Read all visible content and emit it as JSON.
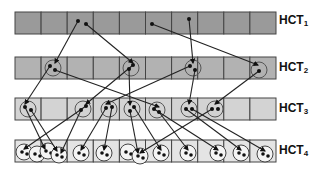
{
  "diagram": {
    "rows": [
      {
        "label": "HCT",
        "sub": "1",
        "y": 12,
        "fill": "#9a9a9a"
      },
      {
        "label": "HCT",
        "sub": "2",
        "y": 57,
        "fill": "#b2b2b2"
      },
      {
        "label": "HCT",
        "sub": "3",
        "y": 98,
        "fill": "#d3d3d3"
      },
      {
        "label": "HCT",
        "sub": "4",
        "y": 140,
        "fill": "#e4e4e4"
      }
    ],
    "grid": {
      "x0": 15,
      "cell_w": 26.1,
      "cell_h": 22,
      "cells": 10
    },
    "row1_dots": [
      [
        78,
        21
      ],
      [
        86,
        24
      ],
      [
        152,
        24
      ],
      [
        189,
        19
      ]
    ],
    "row2_circles": [
      {
        "cx": 53,
        "cy": 68,
        "dots": [
          [
            50,
            66
          ],
          [
            55,
            70
          ]
        ]
      },
      {
        "cx": 131,
        "cy": 68,
        "dots": [
          [
            133,
            65
          ],
          [
            129,
            69
          ]
        ]
      },
      {
        "cx": 193,
        "cy": 68,
        "dots": [
          [
            190,
            66
          ],
          [
            195,
            70
          ]
        ]
      },
      {
        "cx": 259,
        "cy": 70,
        "dots": [
          [
            259,
            71
          ]
        ]
      }
    ],
    "row3_circles": [
      {
        "cx": 28,
        "cy": 109,
        "dots": [
          [
            25,
            107
          ],
          [
            31,
            110
          ]
        ]
      },
      {
        "cx": 83,
        "cy": 109,
        "dots": [
          [
            81,
            110
          ],
          [
            86,
            106
          ]
        ]
      },
      {
        "cx": 109,
        "cy": 109,
        "dots": [
          [
            106,
            108
          ],
          [
            112,
            107
          ]
        ]
      },
      {
        "cx": 132,
        "cy": 109,
        "dots": [
          [
            130,
            111
          ],
          [
            134,
            107
          ]
        ]
      },
      {
        "cx": 157,
        "cy": 110,
        "dots": [
          [
            154,
            109
          ],
          [
            159,
            112
          ]
        ]
      },
      {
        "cx": 189,
        "cy": 109,
        "dots": [
          [
            186,
            109
          ],
          [
            192,
            109
          ]
        ]
      },
      {
        "cx": 215,
        "cy": 109,
        "dots": [
          [
            212,
            109
          ],
          [
            218,
            109
          ]
        ]
      }
    ],
    "row4_circles": [
      {
        "cx": 24,
        "cy": 152
      },
      {
        "cx": 37,
        "cy": 154
      },
      {
        "cx": 48,
        "cy": 151
      },
      {
        "cx": 59,
        "cy": 155
      },
      {
        "cx": 81,
        "cy": 153
      },
      {
        "cx": 104,
        "cy": 153
      },
      {
        "cx": 128,
        "cy": 152
      },
      {
        "cx": 140,
        "cy": 156
      },
      {
        "cx": 161,
        "cy": 153
      },
      {
        "cx": 188,
        "cy": 153
      },
      {
        "cx": 218,
        "cy": 153
      },
      {
        "cx": 241,
        "cy": 153
      },
      {
        "cx": 265,
        "cy": 154
      }
    ],
    "links_1_2": [
      [
        78,
        21,
        55,
        63
      ],
      [
        86,
        24,
        133,
        63
      ],
      [
        152,
        24,
        258,
        65
      ],
      [
        189,
        19,
        193,
        63
      ]
    ],
    "links_2_3": [
      [
        50,
        66,
        25,
        104
      ],
      [
        55,
        70,
        159,
        107
      ],
      [
        133,
        65,
        86,
        104
      ],
      [
        129,
        69,
        130,
        105
      ],
      [
        190,
        66,
        106,
        104
      ],
      [
        195,
        70,
        189,
        104
      ],
      [
        259,
        71,
        215,
        104
      ]
    ],
    "links_3_4": [
      [
        25,
        107,
        45,
        149
      ],
      [
        31,
        110,
        57,
        151
      ],
      [
        86,
        106,
        24,
        149
      ],
      [
        81,
        110,
        61,
        153
      ],
      [
        106,
        108,
        81,
        150
      ],
      [
        112,
        107,
        104,
        150
      ],
      [
        130,
        111,
        138,
        153
      ],
      [
        134,
        107,
        161,
        150
      ],
      [
        154,
        109,
        218,
        150
      ],
      [
        159,
        112,
        188,
        150
      ],
      [
        186,
        109,
        241,
        150
      ],
      [
        192,
        109,
        265,
        151
      ],
      [
        212,
        109,
        140,
        153
      ]
    ]
  }
}
